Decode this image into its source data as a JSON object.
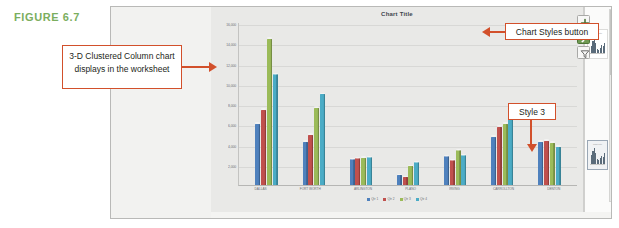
{
  "figure": {
    "label": "FIGURE 6.7",
    "label_color": "#7bae5e"
  },
  "callouts": {
    "worksheet": {
      "text": "3-D Clustered Column chart displays in the worksheet",
      "arrow": "arrow-right"
    },
    "chart_styles_button": {
      "text": "Chart Styles button",
      "arrow": "arrow-left"
    },
    "style3": {
      "text": "Style 3",
      "arrow": "arrow-down"
    },
    "border_color": "#d2502b"
  },
  "chart_buttons": [
    {
      "name": "chart-elements-button",
      "icon": "plus-icon",
      "selected": false
    },
    {
      "name": "chart-styles-button",
      "icon": "paintbrush-icon",
      "selected": true
    },
    {
      "name": "chart-filters-button",
      "icon": "funnel-icon",
      "selected": false
    }
  ],
  "styles_pane": {
    "thumbnails": [
      {
        "name": "style-thumbnail-1",
        "caption": "Chart Title",
        "axis_caption": "",
        "selected": false
      },
      {
        "name": "style-thumbnail-3",
        "caption": "Chart Title",
        "axis_caption": "",
        "selected": true
      }
    ]
  },
  "chart_data": {
    "type": "bar",
    "title": "Chart Title",
    "xlabel": "",
    "ylabel": "",
    "ylim": [
      0,
      16000
    ],
    "yticks": [
      "16,000",
      "14,000",
      "12,000",
      "10,000",
      "8,000",
      "6,000",
      "4,000",
      "2,000"
    ],
    "grid": true,
    "legend_position": "bottom",
    "categories": [
      "DALLAS",
      "FORT WORTH",
      "ARLINGTON",
      "PLANO",
      "IRVING",
      "CARROLLTON",
      "DENTON"
    ],
    "series": [
      {
        "name": "Qtr 1",
        "color": "#4f81bd",
        "values": [
          6200,
          4400,
          2600,
          1000,
          2900,
          4900,
          4400
        ]
      },
      {
        "name": "Qtr 2",
        "color": "#c0504d",
        "values": [
          7600,
          5100,
          2700,
          800,
          2500,
          5900,
          4500
        ]
      },
      {
        "name": "Qtr 3",
        "color": "#9bbb59",
        "values": [
          14800,
          7800,
          2750,
          1900,
          3500,
          6200,
          4300
        ]
      },
      {
        "name": "Qtr 4",
        "color": "#4bacc6",
        "values": [
          11200,
          9200,
          2800,
          2300,
          3000,
          7400,
          3900
        ]
      }
    ]
  }
}
